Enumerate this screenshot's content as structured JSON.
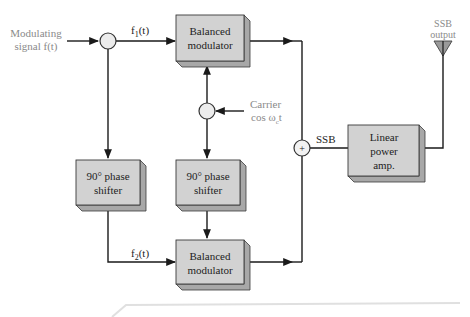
{
  "diagram": {
    "inputs": {
      "modulating_line1": "Modulating",
      "modulating_line2": "signal f(t)",
      "carrier_line1": "Carrier",
      "carrier_line2": "cos ω",
      "carrier_sub": "c",
      "carrier_tail": "t"
    },
    "signals": {
      "f1_base": "f",
      "f1_sub": "1",
      "f1_tail": "(t)",
      "f2_base": "f",
      "f2_sub": "2",
      "f2_tail": "(t)",
      "ssb": "SSB",
      "summer_symbol": "+"
    },
    "blocks": {
      "top_modulator": [
        "Balanced",
        "modulator"
      ],
      "bottom_modulator": [
        "Balanced",
        "modulator"
      ],
      "left_phase_shifter": [
        "90° phase",
        "shifter"
      ],
      "middle_phase_shifter": [
        "90° phase",
        "shifter"
      ],
      "linear_amp": [
        "Linear",
        "power",
        "amp."
      ]
    },
    "output": {
      "line1": "SSB",
      "line2": "output"
    },
    "colors": {
      "block_face": "#d2d2d2",
      "block_side": "#a8a8a8",
      "block_border": "#3a3a3a",
      "line": "#1a1a1a",
      "label_gray": "#8a8a8a",
      "junction_fill": "#ececec",
      "antenna_fill": "#9a9a9a"
    }
  }
}
